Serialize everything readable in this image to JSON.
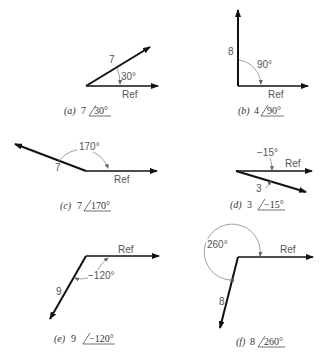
{
  "figure": {
    "ref_label": "Ref",
    "panels": [
      {
        "id": "a",
        "caption_letter": "(a)",
        "magnitude": "7",
        "angle": "30°",
        "magnitude_label": "7",
        "angle_label": "30°"
      },
      {
        "id": "b",
        "caption_letter": "(b)",
        "magnitude": "4",
        "angle": "90°",
        "magnitude_label": "8",
        "angle_label": "90°"
      },
      {
        "id": "c",
        "caption_letter": "(c)",
        "magnitude": "7",
        "angle": "170°",
        "magnitude_label": "7",
        "angle_label": "170°"
      },
      {
        "id": "d",
        "caption_letter": "(d)",
        "magnitude": "3",
        "angle": "−15°",
        "magnitude_label": "3",
        "angle_label": "−15°"
      },
      {
        "id": "e",
        "caption_letter": "(e)",
        "magnitude": "9",
        "angle": "−120°",
        "magnitude_label": "9",
        "angle_label": "−120°"
      },
      {
        "id": "f",
        "caption_letter": "(f)",
        "magnitude": "8",
        "angle": "260°",
        "magnitude_label": "8",
        "angle_label": "260°"
      }
    ]
  }
}
